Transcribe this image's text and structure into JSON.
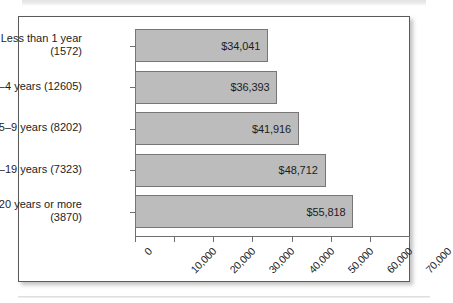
{
  "figure": {
    "artifact_top": "scan-band",
    "artifact_bottom": "scan-rule"
  },
  "chart_data": {
    "type": "bar",
    "orientation": "horizontal",
    "title": "",
    "subtitle": "",
    "xlabel": "",
    "ylabel": "",
    "grid": false,
    "legend": null,
    "xlim": [
      0,
      70000
    ],
    "xticks": [
      0,
      10000,
      20000,
      30000,
      40000,
      50000,
      60000,
      70000
    ],
    "xtick_labels": [
      "0",
      "10,000",
      "20,000",
      "30,000",
      "40,000",
      "50,000",
      "60,000",
      "70,000"
    ],
    "xtick_rotation": -45,
    "categories": [
      "Less than 1 year\n(1572)",
      "1–4 years (12605)",
      "5–9 years (8202)",
      "10–19 years (7323)",
      "20 years or more\n(3870)"
    ],
    "values": [
      34041,
      36393,
      41916,
      48712,
      55818
    ],
    "value_labels": [
      "$34,041",
      "$36,393",
      "$41,916",
      "$48,712",
      "$55,818"
    ],
    "counts": [
      1572,
      12605,
      8202,
      7323,
      3870
    ],
    "bar_color": "#bcbcbc",
    "bar_edge_color": "#767676",
    "axis_color": "#6f6f6f",
    "text_color": "#1d1d1d"
  }
}
